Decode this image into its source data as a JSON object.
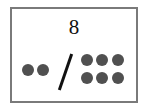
{
  "card": {
    "number": "8",
    "left_dots": 2,
    "right_dots": 6,
    "separator": "/",
    "colors": {
      "border": "#7a7a7a",
      "dot": "#505050",
      "text": "#111111"
    }
  }
}
